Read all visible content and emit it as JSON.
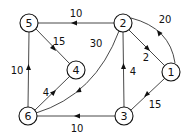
{
  "diagram": {
    "type": "directed-weighted-graph",
    "colors": {
      "stroke": "#333333",
      "node_fill": "#ffffff",
      "text": "#111111"
    },
    "nodes": [
      {
        "id": "1",
        "label": "1",
        "x": 171,
        "y": 72
      },
      {
        "id": "2",
        "label": "2",
        "x": 123,
        "y": 23
      },
      {
        "id": "3",
        "label": "3",
        "x": 124,
        "y": 116
      },
      {
        "id": "4",
        "label": "4",
        "x": 76,
        "y": 70
      },
      {
        "id": "5",
        "label": "5",
        "x": 29,
        "y": 23
      },
      {
        "id": "6",
        "label": "6",
        "x": 28,
        "y": 116
      }
    ],
    "edges": [
      {
        "from": "2",
        "to": "5",
        "weight": "10",
        "shape": "line"
      },
      {
        "from": "1",
        "to": "2",
        "weight": "20",
        "shape": "arc"
      },
      {
        "from": "2",
        "to": "1",
        "weight": "2",
        "shape": "line"
      },
      {
        "from": "3",
        "to": "2",
        "weight": "4",
        "shape": "line"
      },
      {
        "from": "1",
        "to": "3",
        "weight": "15",
        "shape": "line"
      },
      {
        "from": "5",
        "to": "4",
        "weight": "15",
        "shape": "line"
      },
      {
        "from": "6",
        "to": "5",
        "weight": "10",
        "shape": "line"
      },
      {
        "from": "6",
        "to": "4",
        "weight": "4",
        "shape": "line"
      },
      {
        "from": "2",
        "to": "6",
        "weight": "30",
        "shape": "arc"
      },
      {
        "from": "3",
        "to": "6",
        "weight": "10",
        "shape": "line"
      }
    ]
  }
}
